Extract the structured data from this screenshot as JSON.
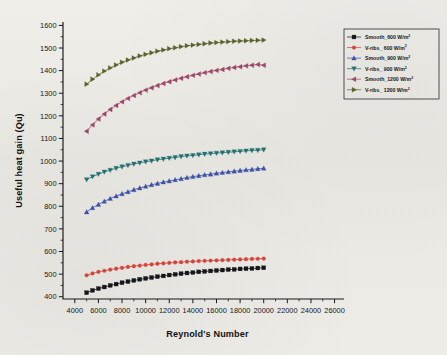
{
  "chart_data": {
    "type": "line",
    "title": "",
    "xlabel": "Reynold's Number",
    "ylabel": "Useful heat gain (Qu)",
    "xlim": [
      3000,
      26800
    ],
    "ylim": [
      390,
      1615
    ],
    "xticks": [
      4000,
      6000,
      8000,
      10000,
      12000,
      14000,
      16000,
      18000,
      20000,
      22000,
      24000,
      26000
    ],
    "yticks": [
      400,
      500,
      600,
      700,
      800,
      900,
      1000,
      1100,
      1200,
      1300,
      1400,
      1500,
      1600
    ],
    "xtick_step": 2000,
    "ytick_step": 100,
    "minor_ticks": true,
    "grid": false,
    "legend_position": "upper-right",
    "x": [
      5000,
      5500,
      6000,
      6500,
      7000,
      7500,
      8000,
      8500,
      9000,
      9500,
      10000,
      10500,
      11000,
      11500,
      12000,
      12500,
      13000,
      13500,
      14000,
      14500,
      15000,
      15500,
      16000,
      16500,
      17000,
      17500,
      18000,
      18500,
      19000,
      19500,
      20000
    ],
    "series": [
      {
        "name": "Smooth_600 W/m",
        "exponent": "2",
        "color": "#14151a",
        "marker": "square",
        "values": [
          418,
          428,
          436,
          443,
          450,
          456,
          462,
          467,
          472,
          477,
          481,
          485,
          489,
          492,
          496,
          499,
          502,
          505,
          507,
          510,
          512,
          514,
          516,
          518,
          520,
          521,
          523,
          524,
          525,
          527,
          528
        ]
      },
      {
        "name": "V-ribs_ 600 W/m",
        "exponent": "2",
        "color": "#d4443a",
        "marker": "circle",
        "values": [
          495,
          503,
          510,
          515,
          520,
          524,
          528,
          532,
          535,
          538,
          541,
          543,
          546,
          548,
          550,
          552,
          553,
          555,
          556,
          558,
          559,
          560,
          561,
          562,
          563,
          564,
          565,
          566,
          567,
          568,
          569
        ]
      },
      {
        "name": "Smooth_900 W/m",
        "exponent": "2",
        "color": "#3a50a6",
        "marker": "triangle-up",
        "values": [
          775,
          793,
          808,
          822,
          834,
          845,
          855,
          864,
          873,
          881,
          888,
          895,
          901,
          907,
          912,
          917,
          922,
          927,
          931,
          935,
          939,
          942,
          946,
          949,
          952,
          955,
          958,
          961,
          963,
          966,
          968
        ]
      },
      {
        "name": "V-ribs_ 900 W/m",
        "exponent": "2",
        "color": "#1f6f70",
        "marker": "triangle-down",
        "values": [
          918,
          931,
          942,
          952,
          960,
          968,
          975,
          981,
          987,
          992,
          997,
          1001,
          1006,
          1009,
          1013,
          1016,
          1020,
          1023,
          1025,
          1028,
          1031,
          1033,
          1035,
          1037,
          1039,
          1041,
          1043,
          1045,
          1047,
          1048,
          1050
        ]
      },
      {
        "name": "Smooth_1200 W/m",
        "exponent": "2",
        "color": "#9e4566",
        "marker": "triangle-left",
        "values": [
          1132,
          1160,
          1186,
          1208,
          1228,
          1246,
          1262,
          1277,
          1290,
          1302,
          1314,
          1324,
          1334,
          1343,
          1351,
          1359,
          1366,
          1373,
          1379,
          1385,
          1391,
          1396,
          1401,
          1405,
          1410,
          1414,
          1417,
          1421,
          1424,
          1427,
          1424
        ]
      },
      {
        "name": "V-ribs_ 1200 W/m",
        "exponent": "2",
        "color": "#5d5f2a",
        "marker": "triangle-right",
        "values": [
          1340,
          1362,
          1381,
          1398,
          1412,
          1425,
          1437,
          1447,
          1456,
          1465,
          1472,
          1479,
          1486,
          1491,
          1497,
          1501,
          1506,
          1510,
          1513,
          1516,
          1519,
          1522,
          1524,
          1526,
          1528,
          1530,
          1531,
          1532,
          1533,
          1534,
          1535
        ]
      }
    ]
  }
}
